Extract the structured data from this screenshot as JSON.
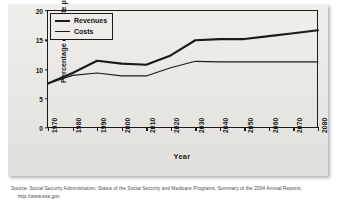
{
  "figure": {
    "plate_background": "#e8e7e3",
    "ink_color": "#1b1b1b"
  },
  "legend": {
    "position": "top-left-inside",
    "entries": [
      {
        "label": "Revenues",
        "style": "thick"
      },
      {
        "label": "Costs",
        "style": "thin"
      }
    ]
  },
  "source": {
    "line1": "Source: Social Security Administration, Status of the Social Security and Medicare Programs, Summary of the 2004 Annual Reports,",
    "line2": "http://www.ssa.gov"
  },
  "chart_data": {
    "type": "line",
    "title": "",
    "xlabel": "Year",
    "ylabel": "Percentage of taxable payroll",
    "xlim": [
      1970,
      2080
    ],
    "ylim": [
      0,
      20
    ],
    "yticks": [
      0,
      5,
      10,
      15,
      20
    ],
    "ytick_labels": [
      "0",
      "5",
      "10",
      "15",
      "20"
    ],
    "xticks": [
      1970,
      1980,
      1990,
      2000,
      2010,
      2020,
      2030,
      2040,
      2050,
      2060,
      2070,
      2080
    ],
    "xtick_labels": [
      "1970",
      "1980",
      "1990",
      "2000",
      "2010",
      "2020",
      "2030",
      "2040",
      "2050",
      "2060",
      "2070",
      "2080"
    ],
    "grid": false,
    "legend_position": "upper left",
    "x": [
      1970,
      1980,
      1990,
      2000,
      2010,
      2020,
      2030,
      2040,
      2050,
      2060,
      2070,
      2080
    ],
    "series": [
      {
        "name": "Revenues",
        "style": "thick",
        "values": [
          7.6,
          9.4,
          11.5,
          11.0,
          10.8,
          12.4,
          15.0,
          15.2,
          15.2,
          15.7,
          16.2,
          16.7
        ]
      },
      {
        "name": "Costs",
        "style": "thin",
        "values": [
          7.6,
          9.0,
          9.4,
          8.9,
          8.9,
          10.3,
          11.4,
          11.3,
          11.3,
          11.3,
          11.3,
          11.3
        ]
      }
    ],
    "annotations": [
      {
        "text": "series cross near 2017",
        "x": 2017,
        "y": 10.0
      }
    ]
  }
}
